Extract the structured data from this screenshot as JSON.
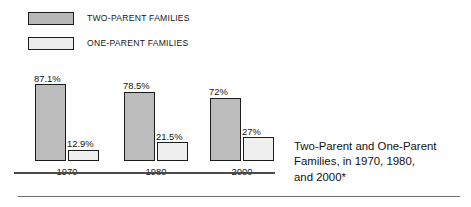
{
  "legend": {
    "items": [
      {
        "label": "TWO-PARENT FAMILIES",
        "swatch": "two-parent-swatch",
        "color": "#b8b8b8"
      },
      {
        "label": "ONE-PARENT FAMILIES",
        "swatch": "one-parent-swatch",
        "color": "#ededed"
      }
    ]
  },
  "caption": {
    "line1": "Two-Parent and One-Parent",
    "line2": "Families, in 1970, 1980,",
    "line3": "and 2000*"
  },
  "chart_data": {
    "type": "bar",
    "title": "Two-Parent and One-Parent Families, in 1970, 1980, and 2000*",
    "xlabel": "",
    "ylabel": "",
    "ylim": [
      0,
      100
    ],
    "grid": false,
    "legend_position": "top-left",
    "categories": [
      "1970",
      "1980",
      "2000"
    ],
    "series": [
      {
        "name": "TWO-PARENT FAMILIES",
        "color": "#bcbcbc",
        "values": [
          87.1,
          78.5,
          72
        ],
        "labels": [
          "87.1%",
          "78.5%",
          "72%"
        ]
      },
      {
        "name": "ONE-PARENT FAMILIES",
        "color": "#efefef",
        "values": [
          12.9,
          21.5,
          27
        ],
        "labels": [
          "12.9%",
          "21.5%",
          "27%"
        ]
      }
    ]
  }
}
